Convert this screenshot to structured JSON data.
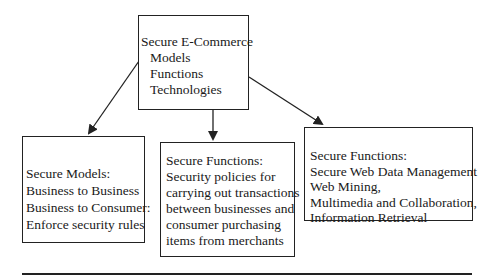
{
  "diagram": {
    "root": {
      "title": "Secure E-Commerce",
      "items": [
        "Models",
        "Functions",
        "Technologies"
      ]
    },
    "children": [
      {
        "lines": [
          "Secure Models:",
          "Business to Business",
          "Business to Consumer:",
          "Enforce security rules"
        ]
      },
      {
        "lines": [
          "Secure Functions:",
          "Security policies for",
          "carrying out transactions",
          "between businesses and",
          "consumer purchasing",
          "items from merchants"
        ]
      },
      {
        "lines": [
          "Secure Functions:",
          "Secure Web Data Management",
          "Web Mining,",
          "Multimedia and Collaboration,",
          "Information Retrieval"
        ]
      }
    ],
    "edges": [
      {
        "from": "root",
        "to": "children.0"
      },
      {
        "from": "root",
        "to": "children.1"
      },
      {
        "from": "root",
        "to": "children.2"
      }
    ]
  }
}
